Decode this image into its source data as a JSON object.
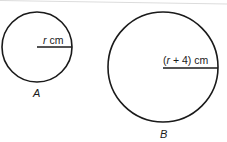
{
  "diagram": {
    "circles": [
      {
        "id": "A",
        "label": "A",
        "radius_var": "r",
        "radius_unit": "cm",
        "radius_text_prefix": "",
        "radius_text_var": "r",
        "radius_text_suffix": " cm",
        "cx": 37,
        "cy": 47,
        "r": 35
      },
      {
        "id": "B",
        "label": "B",
        "radius_text_prefix": "(",
        "radius_text_var": "r",
        "radius_text_suffix": " + 4) cm",
        "cx": 163,
        "cy": 67,
        "r": 55
      }
    ],
    "stroke_color": "#1a1a1a",
    "edge_line_color": "#dcdcdc"
  }
}
